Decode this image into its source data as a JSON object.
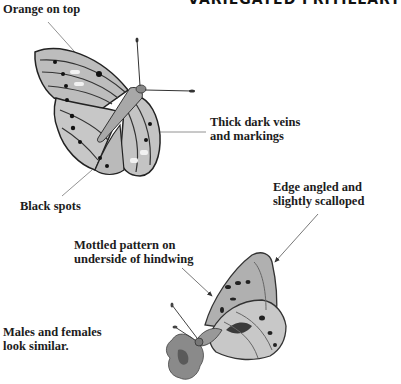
{
  "title": "VARIEGATED FRITILLARY",
  "labels": {
    "orange_on_top": "Orange on top",
    "veins_line1": "Thick dark veins",
    "veins_line2": "and markings",
    "black_spots": "Black spots",
    "edge_line1": "Edge angled and",
    "edge_line2": "slightly scalloped",
    "mottled_line1": "Mottled pattern on",
    "mottled_line2": "underside of hindwing",
    "males_line1": "Males and females",
    "males_line2": "look similar."
  },
  "colors": {
    "ink": "#1c1c1c",
    "leader": "#777777",
    "wing_light": "#d8d8d8",
    "wing_mid": "#9a9a9a",
    "wing_dark": "#333333"
  }
}
